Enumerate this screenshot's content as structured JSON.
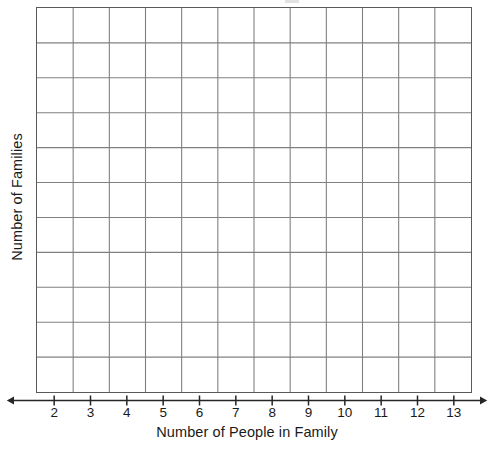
{
  "chart_data": {
    "type": "bar",
    "title": "",
    "subtitle": "",
    "xlabel": "Number of People in Family",
    "ylabel": "Number of Families",
    "categories": [
      "2",
      "3",
      "4",
      "5",
      "6",
      "7",
      "8",
      "9",
      "10",
      "11",
      "12",
      "13"
    ],
    "values": [
      0,
      0,
      0,
      0,
      0,
      0,
      0,
      0,
      0,
      0,
      0,
      0
    ],
    "series": [
      {
        "name": "Number of Families",
        "values": [
          0,
          0,
          0,
          0,
          0,
          0,
          0,
          0,
          0,
          0,
          0,
          0
        ]
      }
    ],
    "note": "Blank worksheet grid: no bars or data marks are drawn; all cells are empty.",
    "xlim": [
      2,
      13
    ],
    "ylim": [
      0,
      11
    ],
    "grid": true,
    "grid_columns": 12,
    "grid_rows": 11,
    "y_tick_labels": [],
    "legend": false,
    "legend_position": "none",
    "annotations": []
  },
  "axes": {
    "x": {
      "title": "Number of People in Family",
      "tick_labels": [
        "2",
        "3",
        "4",
        "5",
        "6",
        "7",
        "8",
        "9",
        "10",
        "11",
        "12",
        "13"
      ],
      "arrow_style": "double-headed",
      "tick_count": 12
    },
    "y": {
      "title": "Number of Families",
      "tick_labels": [],
      "rotation": "vertical-ccw",
      "grid_row_count": 11
    }
  },
  "style": {
    "background_color": "#ffffff",
    "grid_border_color": "#5a5a5a",
    "grid_line_color": "#808080",
    "axis_color": "#262626",
    "text_color": "#1a1a1a"
  }
}
